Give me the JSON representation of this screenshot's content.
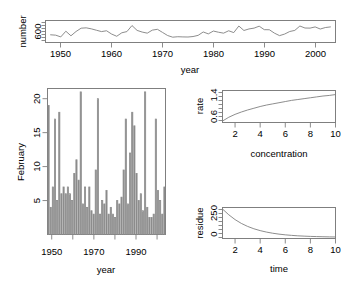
{
  "figure": {
    "title": "",
    "panel_count": 4
  },
  "chart_data": [
    {
      "id": "timeseries-number-year",
      "type": "line",
      "title": "",
      "xlabel": "year",
      "ylabel": "number",
      "xlim": [
        1947,
        2004
      ],
      "ylim": [
        520,
        760
      ],
      "xticks": [
        1950,
        1960,
        1970,
        1980,
        1990,
        2000
      ],
      "xticklabels": [
        "1950",
        "1960",
        "1970",
        "1980",
        "1990",
        "2000"
      ],
      "yticks": [
        600
      ],
      "yticklabels": [
        "600"
      ],
      "grid": false,
      "legend": null,
      "x": [
        1948,
        1949,
        1950,
        1951,
        1952,
        1953,
        1954,
        1955,
        1956,
        1957,
        1958,
        1959,
        1960,
        1961,
        1962,
        1963,
        1964,
        1965,
        1966,
        1967,
        1968,
        1969,
        1970,
        1971,
        1972,
        1973,
        1974,
        1975,
        1976,
        1977,
        1978,
        1979,
        1980,
        1981,
        1982,
        1983,
        1984,
        1985,
        1986,
        1987,
        1988,
        1989,
        1990,
        1991,
        1992,
        1993,
        1994,
        1995,
        1996,
        1997,
        1998,
        1999,
        2000,
        2001,
        2002,
        2003
      ],
      "values": [
        604,
        600,
        581,
        643,
        593,
        640,
        676,
        680,
        669,
        654,
        639,
        648,
        612,
        588,
        626,
        639,
        705,
        652,
        634,
        622,
        655,
        664,
        630,
        596,
        578,
        583,
        581,
        580,
        585,
        598,
        635,
        614,
        645,
        632,
        622,
        648,
        628,
        700,
        651,
        668,
        677,
        698,
        660,
        659,
        622,
        595,
        612,
        640,
        652,
        700,
        678,
        677,
        690,
        667,
        683,
        690
      ]
    },
    {
      "id": "february-barplot",
      "type": "bar",
      "title": "",
      "xlabel": "year",
      "ylabel": "February",
      "xlim": [
        1948,
        2004
      ],
      "ylim": [
        0,
        21.5
      ],
      "xticks": [
        1950,
        1960,
        1970,
        1980,
        1990,
        2000
      ],
      "xticklabels": [
        "1950",
        "",
        "1970",
        "",
        "1990",
        ""
      ],
      "xticklabels_major": [
        "1950",
        "1970",
        "1990"
      ],
      "yticks": [
        5,
        10,
        15,
        20
      ],
      "yticklabels": [
        "5",
        "10",
        "15",
        "20"
      ],
      "grid": false,
      "legend": null,
      "categories": [
        1949,
        1950,
        1951,
        1952,
        1953,
        1954,
        1955,
        1956,
        1957,
        1958,
        1959,
        1960,
        1961,
        1962,
        1963,
        1964,
        1965,
        1966,
        1967,
        1968,
        1969,
        1970,
        1971,
        1972,
        1973,
        1974,
        1975,
        1976,
        1977,
        1978,
        1979,
        1980,
        1981,
        1982,
        1983,
        1984,
        1985,
        1986,
        1987,
        1988,
        1989,
        1990,
        1991,
        1992,
        1993,
        1994,
        1995,
        1996,
        1997,
        1998,
        1999,
        2000,
        2001,
        2002,
        2003
      ],
      "values": [
        19.0,
        4.0,
        7.0,
        17.0,
        5.0,
        18.0,
        6.0,
        7.0,
        6.0,
        7.0,
        6.0,
        5.0,
        9.0,
        11.0,
        8.0,
        21.0,
        4.5,
        7.0,
        4.0,
        7.0,
        3.5,
        3.0,
        9.5,
        20.0,
        3.0,
        5.0,
        4.5,
        6.5,
        3.0,
        4.0,
        3.0,
        2.5,
        5.0,
        4.5,
        5.5,
        9.5,
        17.0,
        4.5,
        12.0,
        18.0,
        16.0,
        9.0,
        5.0,
        6.0,
        3.5,
        21.0,
        4.0,
        2.5,
        2.5,
        3.0,
        17.0,
        6.5,
        5.0,
        3.0,
        7.0
      ]
    },
    {
      "id": "rate-concentration-curve",
      "type": "line",
      "title": "",
      "xlabel": "concentration",
      "ylabel": "rate",
      "xlim": [
        1,
        10
      ],
      "ylim": [
        0.45,
        1.55
      ],
      "xticks": [
        2,
        4,
        6,
        8,
        10
      ],
      "xticklabels": [
        "2",
        "4",
        "6",
        "8",
        "10"
      ],
      "yticks": [
        0.6,
        1.4
      ],
      "yticklabels": [
        "0.6",
        "1.4"
      ],
      "grid": false,
      "legend": null,
      "curve": "michaelis-menten",
      "x": [
        1,
        1.5,
        2,
        2.5,
        3,
        3.5,
        4,
        4.5,
        5,
        5.5,
        6,
        6.5,
        7,
        7.5,
        8,
        8.5,
        9,
        9.5,
        10
      ],
      "values": [
        0.5,
        0.63,
        0.73,
        0.81,
        0.88,
        0.94,
        1.0,
        1.05,
        1.09,
        1.13,
        1.17,
        1.21,
        1.24,
        1.27,
        1.3,
        1.33,
        1.36,
        1.38,
        1.41
      ]
    },
    {
      "id": "residue-time-decay",
      "type": "line",
      "title": "",
      "xlabel": "time",
      "ylabel": "residue",
      "xlim": [
        1,
        10
      ],
      "ylim": [
        -15,
        390
      ],
      "xticks": [
        2,
        4,
        6,
        8,
        10
      ],
      "xticklabels": [
        "2",
        "4",
        "6",
        "8",
        "10"
      ],
      "yticks": [
        0,
        250
      ],
      "yticklabels": [
        "0",
        "250"
      ],
      "grid": false,
      "legend": null,
      "curve": "exponential-decay",
      "x": [
        1,
        1.5,
        2,
        2.5,
        3,
        3.5,
        4,
        4.5,
        5,
        5.5,
        6,
        6.5,
        7,
        7.5,
        8,
        8.5,
        9,
        9.5,
        10
      ],
      "values": [
        370,
        295,
        232,
        182,
        143,
        112,
        88,
        69,
        54,
        42,
        33,
        26,
        20,
        16,
        12.5,
        10,
        8,
        6,
        5
      ]
    }
  ],
  "panels": {
    "timeseries": {
      "ylabel": "number",
      "xlabel": "year",
      "ytick_0": "600",
      "xtick_0": "1950",
      "xtick_1": "1960",
      "xtick_2": "1970",
      "xtick_3": "1980",
      "xtick_4": "1990",
      "xtick_5": "2000"
    },
    "february": {
      "ylabel": "February",
      "xlabel": "year",
      "ytick_0": "5",
      "ytick_1": "10",
      "ytick_2": "15",
      "ytick_3": "20",
      "xtick_0": "1950",
      "xtick_1": "1970",
      "xtick_2": "1990"
    },
    "rate": {
      "ylabel": "rate",
      "xlabel": "concentration",
      "ytick_0": "0.6",
      "ytick_1": "1.4",
      "xtick_0": "2",
      "xtick_1": "4",
      "xtick_2": "6",
      "xtick_3": "8",
      "xtick_4": "10"
    },
    "residue": {
      "ylabel": "residue",
      "xlabel": "time",
      "ytick_0": "0",
      "ytick_1": "250",
      "xtick_0": "2",
      "xtick_1": "4",
      "xtick_2": "6",
      "xtick_3": "8",
      "xtick_4": "10"
    }
  },
  "colors": {
    "background": "#ffffff",
    "ink": "#000000",
    "line": "#808080",
    "box": "#7f7f7f",
    "bar": "#8c8c8c"
  }
}
